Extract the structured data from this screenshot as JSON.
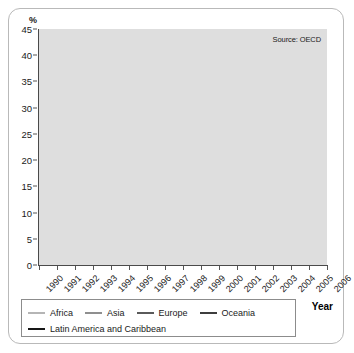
{
  "axis_title_y": "%",
  "axis_title_x": "Year",
  "source_note": "Source: OECD",
  "legend": {
    "row1": [
      {
        "label": "Africa",
        "color": "#b5b5b5"
      },
      {
        "label": "Asia",
        "color": "#8f8f8f"
      },
      {
        "label": "Europe",
        "color": "#5a5a5a"
      },
      {
        "label": "Oceania",
        "color": "#3d3d3d"
      }
    ],
    "row2": [
      {
        "label": "Latin America and Caribbean",
        "color": "#171717"
      }
    ]
  },
  "chart_data": {
    "type": "line",
    "title": "",
    "subtitle": "",
    "xlabel": "Year",
    "ylabel": "%",
    "xlim": [
      1990,
      2006
    ],
    "ylim": [
      0,
      45
    ],
    "ytick_step": 5,
    "yticks": [
      0,
      5,
      10,
      15,
      20,
      25,
      30,
      35,
      40,
      45
    ],
    "grid": true,
    "grid_orientation": "horizontal",
    "legend_position": "bottom",
    "annotations": [
      "Source: OECD"
    ],
    "x": [
      1990,
      1991,
      1992,
      1993,
      1994,
      1995,
      1996,
      1997,
      1998,
      1999,
      2000,
      2001,
      2002,
      2003,
      2004,
      2005,
      2006
    ],
    "categories": [
      "1990",
      "1991",
      "1992",
      "1993",
      "1994",
      "1995",
      "1996",
      "1997",
      "1998",
      "1999",
      "2000",
      "2001",
      "2002",
      "2003",
      "2004",
      "2005",
      "2006"
    ],
    "series": [
      {
        "name": "Africa",
        "color": "#b5b5b5",
        "values": [
          44.0,
          40.6,
          40.3,
          37.8,
          38.7,
          36.8,
          35.3,
          36.9,
          34.0,
          30.6,
          31.9,
          32.4,
          35.7,
          38.1,
          28.6,
          29.0,
          41.0
        ]
      },
      {
        "name": "Asia",
        "color": "#8f8f8f",
        "values": [
          31.5,
          33.2,
          32.4,
          31.1,
          34.7,
          31.4,
          32.9,
          29.2,
          31.0,
          33.3,
          32.0,
          32.3,
          31.6,
          36.5,
          37.0,
          42.3,
          31.4
        ]
      },
      {
        "name": "Europe",
        "color": "#5a5a5a",
        "values": [
          9.1,
          9.7,
          8.8,
          9.3,
          9.6,
          10.8,
          13.4,
          11.3,
          11.0,
          11.1,
          9.6,
          11.4,
          8.3,
          5.1,
          5.4,
          4.0,
          4.9
        ]
      },
      {
        "name": "Oceania",
        "color": "#3d3d3d",
        "values": [
          2.4,
          2.2,
          2.6,
          2.7,
          2.9,
          3.0,
          3.2,
          3.3,
          3.3,
          2.7,
          1.9,
          1.8,
          1.6,
          1.5,
          1.4,
          1.4,
          1.4
        ]
      },
      {
        "name": "Latin America and Caribbean",
        "color": "#171717",
        "values": [
          2.7,
          3.7,
          3.9,
          6.2,
          3.7,
          4.0,
          3.9,
          3.9,
          4.2,
          7.0,
          7.4,
          6.6,
          8.3,
          8.7,
          8.7,
          6.2,
          6.7
        ]
      }
    ]
  }
}
